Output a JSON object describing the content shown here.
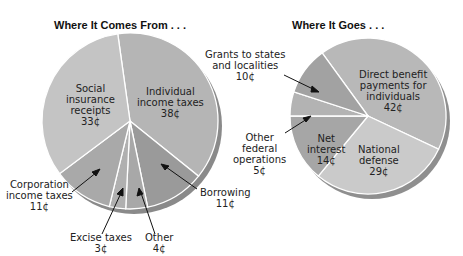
{
  "chart_data": [
    {
      "type": "pie",
      "title": "Where It Comes From . . .",
      "unit": "¢",
      "categories": [
        "Individual income taxes",
        "Borrowing",
        "Other",
        "Excise taxes",
        "Corporation income taxes",
        "Social insurance receipts"
      ],
      "values": [
        38,
        11,
        4,
        3,
        11,
        33
      ],
      "colors": [
        "#b5b5b5",
        "#9a9a9a",
        "#a8a8a8",
        "#b0b0b0",
        "#a9a9a9",
        "#c4c4c4"
      ]
    },
    {
      "type": "pie",
      "title": "Where It Goes . . .",
      "unit": "¢",
      "categories": [
        "Direct benefit payments for individuals",
        "National defense",
        "Net interest",
        "Other federal operations",
        "Grants to states and localities"
      ],
      "values": [
        42,
        29,
        14,
        5,
        10
      ],
      "colors": [
        "#b8b8b8",
        "#cacaca",
        "#a6a6a6",
        "#b3b3b3",
        "#a2a2a2"
      ]
    }
  ],
  "left": {
    "title": "Where It Comes From . . .",
    "labels": {
      "social": [
        "Social",
        "insurance",
        "receipts",
        "33¢"
      ],
      "individual": [
        "Individual",
        "income taxes",
        "38¢"
      ],
      "corporation": [
        "Corporation",
        "income taxes",
        "11¢"
      ],
      "excise": [
        "Excise taxes",
        "3¢"
      ],
      "other": [
        "Other",
        "4¢"
      ],
      "borrowing": [
        "Borrowing",
        "11¢"
      ]
    }
  },
  "right": {
    "title": "Where It Goes . . .",
    "labels": {
      "grants": [
        "Grants to states",
        "and localities",
        "10¢"
      ],
      "direct": [
        "Direct benefit",
        "payments for",
        "individuals",
        "42¢"
      ],
      "otherfed": [
        "Other",
        "federal",
        "operations",
        "5¢"
      ],
      "interest": [
        "Net",
        "interest",
        "14¢"
      ],
      "defense": [
        "National",
        "defense",
        "29¢"
      ]
    }
  }
}
